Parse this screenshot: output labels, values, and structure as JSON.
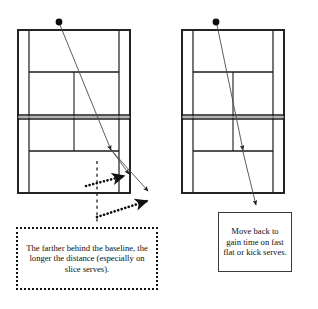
{
  "figure": {
    "type": "tennis-court-serve-diagram",
    "panel_count": 2,
    "background_color": "#ffffff",
    "line_color": "#1a1a1a"
  },
  "panels": [
    {
      "id": "left-panel",
      "name": "serve-from-deep-behind-baseline",
      "court": {
        "outer_left": 18,
        "outer_top": 30,
        "outer_right": 130,
        "outer_bottom": 193,
        "singles_inset": 11,
        "net_y": 117,
        "service_line_top_y": 72,
        "service_line_bottom_y": 151
      },
      "server_marker": {
        "name": "ball-dot",
        "x": 59,
        "y": 22,
        "radius": 3.4
      },
      "trajectory": {
        "name": "serve-path-arrow",
        "from_x": 60,
        "from_y": 25,
        "to_x": 148,
        "to_y": 190,
        "mid_arrow_x": 110,
        "mid_arrow_y": 149,
        "second_arrow_x": 128,
        "second_arrow_y": 173
      },
      "dashed_reference_line": {
        "x": 97,
        "y_top": 161,
        "y_bottom": 222
      },
      "dotted_arrows": [
        {
          "name": "short-distance-arrow",
          "from_x": 88,
          "from_y": 185,
          "to_x": 126,
          "to_y": 176
        },
        {
          "name": "long-distance-arrow",
          "from_x": 97,
          "from_y": 216,
          "to_x": 149,
          "to_y": 200
        }
      ]
    },
    {
      "id": "right-panel",
      "name": "returner-moves-back",
      "court": {
        "outer_left": 182,
        "outer_top": 30,
        "outer_right": 284,
        "outer_bottom": 193,
        "singles_inset": 11,
        "net_y": 117,
        "service_line_top_y": 72,
        "service_line_bottom_y": 151
      },
      "server_marker": {
        "name": "ball-dot",
        "x": 216,
        "y": 22,
        "radius": 3.4
      },
      "trajectory": {
        "name": "serve-path-arrow",
        "from_x": 217,
        "from_y": 25,
        "to_x": 256,
        "to_y": 204,
        "mid_arrow_x": 242,
        "mid_arrow_y": 149
      }
    }
  ],
  "captions": {
    "left": {
      "name": "caption-slice-serve-distance",
      "text": "The farther behind the baseline, the longer the distance (especially on slice serves).",
      "border_style": "dotted"
    },
    "right": {
      "name": "caption-move-back",
      "text": "Move back to gain time on fast flat or kick serves.",
      "border_style": "solid"
    }
  }
}
